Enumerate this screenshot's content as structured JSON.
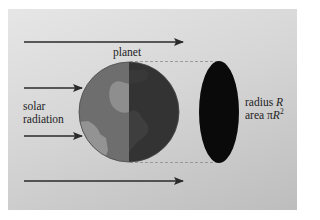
{
  "figure": {
    "labels": {
      "planet": "planet",
      "solar_line1": "solar",
      "solar_line2": "radiation",
      "radius_prefix": "radius ",
      "radius_symbol": "R",
      "area_prefix": "area ",
      "area_pi": "π",
      "area_symbol": "R",
      "area_exponent": "2"
    },
    "colors": {
      "background_light": "#e6e6e6",
      "background_dark": "#bdbdbd",
      "arrow": "#2a2a2a",
      "lit_ocean": "#6e6e6e",
      "lit_land": "#8e8e8e",
      "night_side": "#333333",
      "night_land": "#3d3d3d",
      "shadow_disk": "#0a0a0a",
      "dashed_line": "#8a8a8a"
    },
    "arrows": [
      {
        "name": "top",
        "y": 42,
        "x1": 24,
        "x2": 183
      },
      {
        "name": "upper-middle",
        "y": 88,
        "x1": 24,
        "x2": 82
      },
      {
        "name": "lower-middle",
        "y": 136,
        "x1": 24,
        "x2": 82
      },
      {
        "name": "bottom",
        "y": 181,
        "x1": 24,
        "x2": 183
      }
    ]
  }
}
